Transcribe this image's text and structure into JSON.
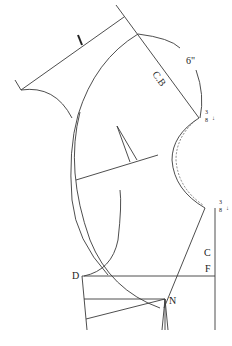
{
  "diagram": {
    "type": "sewing pattern draft (collar / bodice front and back)",
    "labels": {
      "center_back": "C.B",
      "center_front_c": "C",
      "center_front_f": "F",
      "point_d": "D",
      "point_n": "N",
      "measure_6in": "6\"",
      "fraction_top_num": "3",
      "fraction_top_den": "8",
      "fraction_bottom_num": "3",
      "fraction_bottom_den": "8"
    },
    "colors": {
      "line": "#3a3a3a",
      "text": "#222222",
      "background": "#ffffff"
    }
  }
}
